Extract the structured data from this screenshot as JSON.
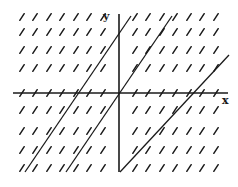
{
  "diagram": {
    "type": "slope-field",
    "axes": {
      "x_label": "x",
      "y_label": "y",
      "origin_px": [
        119,
        93
      ],
      "x_axis_px": [
        13,
        228
      ],
      "y_axis_px": [
        14,
        172
      ]
    },
    "slope": 1.5,
    "grid": {
      "rows_px": [
        17,
        32,
        50,
        68,
        93,
        110,
        131,
        150,
        168
      ],
      "cols_px": [
        22,
        35,
        49,
        62,
        76,
        89,
        103,
        135,
        148,
        162,
        175,
        189,
        202,
        216
      ],
      "dash_half_len_px": 4,
      "colors": {
        "ink": "#1a1a1a",
        "background": "#ffffff"
      }
    },
    "solution_lines": [
      {
        "name": "line-left",
        "from": [
          25,
          172
        ],
        "to": [
          131,
          16
        ]
      },
      {
        "name": "line-through-origin",
        "from": [
          66,
          172
        ],
        "to": [
          172,
          16
        ]
      },
      {
        "name": "line-right",
        "from": [
          120,
          172
        ],
        "to": [
          229,
          55
        ]
      }
    ]
  }
}
